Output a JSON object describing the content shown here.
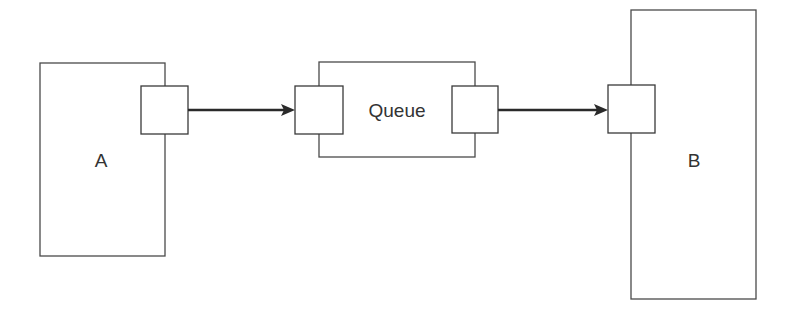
{
  "diagram": {
    "nodes": [
      {
        "id": "A",
        "label": "A"
      },
      {
        "id": "Queue",
        "label": "Queue"
      },
      {
        "id": "B",
        "label": "B"
      }
    ],
    "edges": [
      {
        "from": "A.out",
        "to": "Queue.in"
      },
      {
        "from": "Queue.out",
        "to": "B.in"
      }
    ],
    "colors": {
      "stroke": "#4a4a4a",
      "arrow": "#2a2a2a",
      "text": "#333333"
    }
  }
}
